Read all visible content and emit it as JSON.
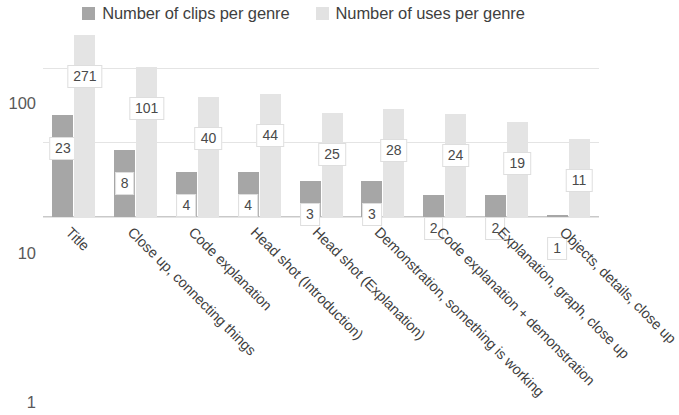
{
  "chart_data": {
    "type": "bar",
    "title": "",
    "subtitle": "",
    "xlabel": "",
    "ylabel": "",
    "yscale": "log",
    "ylim": [
      1,
      300
    ],
    "yticks": [
      1,
      10,
      100
    ],
    "ytick_labels": [
      "1",
      "10",
      "100"
    ],
    "grid": true,
    "legend_position": "top-center",
    "categories": [
      "Title",
      "Close up, connecting things",
      "Code explanation",
      "Head shot (Introduction)",
      "Head shot (Explanation)",
      "Demonstration, something is working",
      "Code explanation + demonstration",
      "Explanation, graph, close up",
      "Objects, details, close up"
    ],
    "series": [
      {
        "name": "Number of clips per genre",
        "color": "#a6a6a6",
        "values": [
          23,
          8,
          4,
          4,
          3,
          3,
          2,
          2,
          1
        ],
        "labels": [
          "23",
          "8",
          "4",
          "4",
          "3",
          "3",
          "2",
          "2",
          "1"
        ]
      },
      {
        "name": "Number of uses per genre",
        "color": "#e4e4e4",
        "values": [
          271,
          101,
          40,
          44,
          25,
          28,
          24,
          19,
          11
        ],
        "labels": [
          "271",
          "101",
          "40",
          "44",
          "25",
          "28",
          "24",
          "19",
          "11"
        ]
      }
    ]
  },
  "legend": {
    "entries": [
      {
        "label": "Number of clips per genre",
        "swatch": "series-clips"
      },
      {
        "label": "Number of uses per genre",
        "swatch": "series-uses"
      }
    ]
  },
  "colors": {
    "series_clips": "#a6a6a6",
    "series_uses": "#e4e4e4",
    "gridline": "#e4e4e4",
    "axis": "#c9c9c9",
    "text": "#3f3f3f",
    "background": "#ffffff"
  }
}
